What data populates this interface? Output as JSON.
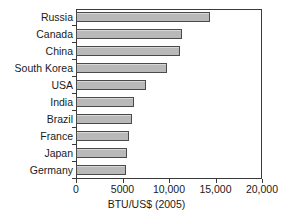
{
  "chart_data": {
    "type": "bar",
    "orientation": "horizontal",
    "title": "",
    "xlabel": "BTU/US$ (2005)",
    "ylabel": "",
    "categories": [
      "Russia",
      "Canada",
      "China",
      "South Korea",
      "USA",
      "India",
      "Brazil",
      "France",
      "Japan",
      "Germany"
    ],
    "values": [
      14400,
      11400,
      11200,
      9800,
      7500,
      6200,
      6000,
      5700,
      5500,
      5400
    ],
    "xlim": [
      0,
      20000
    ],
    "xticks": [
      0,
      5000,
      10000,
      15000,
      20000
    ],
    "xtick_labels": [
      "0",
      "5000",
      "10,000",
      "15,000",
      "20,000"
    ],
    "grid": false,
    "legend": null,
    "bar_color": "#b9b9b9",
    "bar_edge_color": "#4a4a4a",
    "frame_color": "#3a3a3a"
  }
}
